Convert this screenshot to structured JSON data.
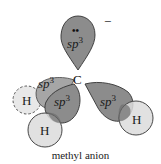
{
  "title": "methyl anion",
  "central_atom": "C",
  "charge": "−",
  "lone_pair": "••",
  "orbital_label": "sp",
  "orbital_superscript": "3",
  "hydrogen_label": "H",
  "colors": {
    "orbital_fill": "#8c8c8c",
    "orbital_back_fill": "#a6a6a6",
    "hydrogen_fill": "#dcdcdc",
    "hydrogen_back_fill": "#e8e8e8",
    "stroke": "#333333",
    "overlap_fill": "#6e6e6e"
  },
  "orbitals": [
    {
      "id": "top",
      "contains": "lone pair"
    },
    {
      "id": "back-left",
      "bonded_to": "H (dashed, behind)"
    },
    {
      "id": "front-left",
      "bonded_to": "H (bottom)"
    },
    {
      "id": "right",
      "bonded_to": "H (right)"
    }
  ]
}
